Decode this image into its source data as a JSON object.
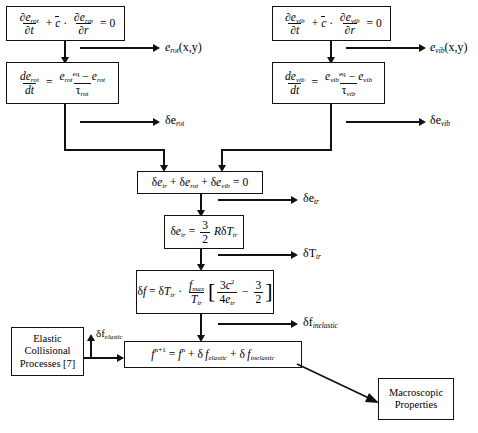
{
  "diagram": {
    "boxes": {
      "rot_transport": {
        "lhs_num": "∂e",
        "lhs_sub": "rot",
        "formula_text": "∂e_rot/∂t + c̄ · ∂e_rot/∂r = 0"
      },
      "rot_relax": {
        "formula_text": "de_rot/dt = (e_rot^eq − e_rot)/τ_rot"
      },
      "vib_transport": {
        "formula_text": "∂e_vib/∂t + c̄ · ∂e_vib/∂r = 0"
      },
      "vib_relax": {
        "formula_text": "de_vib/dt = (e_vib^eq − e_vib)/τ_vib"
      },
      "energy_balance": {
        "formula_text": "δe_tr + δe_rot + δe_vib = 0"
      },
      "tr_energy": {
        "formula_text": "δe_tr = (3/2) RδT_tr"
      },
      "delta_f": {
        "formula_text": "δf = δT_tr · (f_max/T_tr) [ 3c²/(4e_tr) − 3/2 ]"
      },
      "elastic_collisional": {
        "line1": "Elastic",
        "line2": "Collisional",
        "line3": "Processes [7]"
      },
      "f_update": {
        "formula_text": "f^(n+1) = f^n + δ f_elastic + δ f_inelastic"
      },
      "macroscopic": {
        "line1": "Macroscopic",
        "line2": "Properties"
      }
    },
    "output_labels": {
      "e_rot_xy": "e_rot(x,y)",
      "e_vib_xy": "e_vib(x,y)",
      "delta_e_rot": "δe_rot",
      "delta_e_vib": "δe_vib",
      "delta_e_tr": "δe_tr",
      "delta_T_tr": "δT_tr",
      "delta_f_inelastic": "δf_inelastic",
      "delta_f_elastic": "δf_elastic"
    },
    "symbols": {
      "partial": "∂",
      "delta": "δ",
      "tau": "τ",
      "zero": "0",
      "equals": "=",
      "plus": "+",
      "minus": "−",
      "cdot": "·",
      "three": "3",
      "two": "2",
      "four": "4",
      "R": "R",
      "t": "t",
      "r": "r",
      "eq": "eq",
      "max": "max",
      "rot": "rot",
      "vib": "vib",
      "tr": "tr",
      "e": "e",
      "f": "f",
      "T": "T",
      "c": "c",
      "x_y": "(x,y)",
      "n": "n",
      "n_plus_1": "n+1",
      "elastic": "elastic",
      "inelastic": "inelastic",
      "xi": "c"
    },
    "colors": {
      "line": "#111111",
      "background": "#ffffff",
      "text": "#000000"
    }
  }
}
